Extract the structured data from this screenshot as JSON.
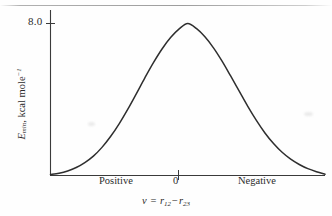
{
  "figure": {
    "name": "potential-energy-barrier-curve",
    "background_color": "#fefefe",
    "ink_color": "#2b2b2b"
  },
  "axes": {
    "y_title_symbol": "E",
    "y_title_subscript": "min",
    "y_title_units": ", kcal mole",
    "y_title_units_exponent": "−1",
    "y_tick_label": "8.0",
    "x_tick_labels": [
      "Positive",
      "0",
      "Negative"
    ],
    "x_title_lhs": "v",
    "x_title_equals": " = ",
    "x_title_term1": "r",
    "x_title_term1_sub": "12",
    "x_title_operator": "−",
    "x_title_term2": "r",
    "x_title_term2_sub": "23"
  },
  "chart_data": {
    "type": "line",
    "title": "",
    "xlabel": "v = r12 − r23",
    "ylabel": "Emin, kcal mole−1",
    "xlim": [
      -4.0,
      4.0
    ],
    "ylim": [
      0,
      8.6
    ],
    "grid": false,
    "legend": null,
    "y_ticks": [
      8.0
    ],
    "x_ticks": [
      0
    ],
    "x_tick_text": [
      "Positive",
      "0",
      "Negative"
    ],
    "x_axis_direction_note": "Positive to the left of 0, Negative to the right of 0",
    "series": [
      {
        "name": "Emin",
        "shape": "bell-curve",
        "peak_x": 0,
        "peak_y": 8.0,
        "x": [
          -4.0,
          -3.75,
          -3.5,
          -3.25,
          -3.0,
          -2.75,
          -2.5,
          -2.25,
          -2.0,
          -1.75,
          -1.5,
          -1.25,
          -1.0,
          -0.75,
          -0.5,
          -0.25,
          0.0,
          0.25,
          0.5,
          0.75,
          1.0,
          1.25,
          1.5,
          1.75,
          2.0,
          2.25,
          2.5,
          2.75,
          3.0,
          3.25,
          3.5,
          3.75,
          4.0
        ],
        "values": [
          0.05,
          0.12,
          0.24,
          0.42,
          0.68,
          1.02,
          1.48,
          2.05,
          2.72,
          3.48,
          4.3,
          5.14,
          5.94,
          6.66,
          7.26,
          7.72,
          8.0,
          7.74,
          7.3,
          6.72,
          6.02,
          5.24,
          4.44,
          3.64,
          2.9,
          2.24,
          1.68,
          1.22,
          0.86,
          0.58,
          0.36,
          0.2,
          0.07
        ]
      }
    ]
  }
}
